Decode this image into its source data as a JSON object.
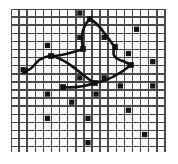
{
  "figure": {
    "width": 178,
    "height": 164,
    "background_color": "#ffffff"
  },
  "grid": {
    "origin_x": 11,
    "origin_y": 9,
    "width": 155,
    "height": 143,
    "columns": 19,
    "rows": 18,
    "cell_size": 8.1,
    "line_color": "#4a4a4a",
    "line_width": 1.45,
    "fill_color": "#fdfdfd"
  },
  "marks": {
    "fill_color": "#161616",
    "cell_inset": 1.4,
    "label": "filled grid cells",
    "cells": [
      {
        "col": 1,
        "row": 7
      },
      {
        "col": 4,
        "row": 4
      },
      {
        "col": 8,
        "row": 0
      },
      {
        "col": 8,
        "row": 3
      },
      {
        "col": 11,
        "row": 3
      },
      {
        "col": 15,
        "row": 2
      },
      {
        "col": 8,
        "row": 8
      },
      {
        "col": 11,
        "row": 8
      },
      {
        "col": 14,
        "row": 5
      },
      {
        "col": 17,
        "row": 6
      },
      {
        "col": 4,
        "row": 10
      },
      {
        "col": 7,
        "row": 11
      },
      {
        "col": 10,
        "row": 10
      },
      {
        "col": 13,
        "row": 9
      },
      {
        "col": 17,
        "row": 9
      },
      {
        "col": 4,
        "row": 13
      },
      {
        "col": 9,
        "row": 13
      },
      {
        "col": 14,
        "row": 12
      },
      {
        "col": 16,
        "row": 15
      },
      {
        "col": 9,
        "row": 16
      }
    ]
  },
  "network": {
    "stroke_color": "#111111",
    "stroke_width": 2.6,
    "label": "curved connecting paths between marked nodes",
    "nodes": [
      {
        "id": "n-left",
        "x": 14,
        "y": 62
      },
      {
        "id": "n-midleft",
        "x": 40,
        "y": 47
      },
      {
        "id": "n-center",
        "x": 72,
        "y": 40
      },
      {
        "id": "n-top",
        "x": 79,
        "y": 10
      },
      {
        "id": "n-right-upper",
        "x": 104,
        "y": 38
      },
      {
        "id": "n-right-lower",
        "x": 120,
        "y": 56
      },
      {
        "id": "n-lower-mid",
        "x": 84,
        "y": 74
      },
      {
        "id": "n-lower-left",
        "x": 52,
        "y": 78
      }
    ],
    "edges": [
      {
        "id": "e-left-midleft",
        "path": "M 14 62 C 22 62 24 52 30 50 C 34 48 36 47 40 47"
      },
      {
        "id": "e-midleft-center",
        "path": "M 40 47 C 52 47 62 43 72 40"
      },
      {
        "id": "e-center-top",
        "path": "M 72 40 C 70 30 70 18 79 10"
      },
      {
        "id": "e-top-rightupper",
        "path": "M 79 10 C 90 16 92 24 98 30 C 100 33 102 36 104 38"
      },
      {
        "id": "e-rightupper-rightlower",
        "path": "M 104 38 C 100 46 104 50 112 52 C 116 54 118 55 120 56"
      },
      {
        "id": "e-rightlower-lowermid",
        "path": "M 120 56 C 110 64 96 72 84 74"
      },
      {
        "id": "e-lowermid-midleft",
        "path": "M 84 74 C 74 70 58 50 40 47"
      },
      {
        "id": "e-lowermid-lowerleft",
        "path": "M 84 74 C 72 78 62 79 52 78"
      }
    ],
    "thin_edges": [
      {
        "id": "e-thin-lowerleft-lowermid",
        "path": "M 52 79 C 66 79 78 76 88 72"
      }
    ]
  }
}
